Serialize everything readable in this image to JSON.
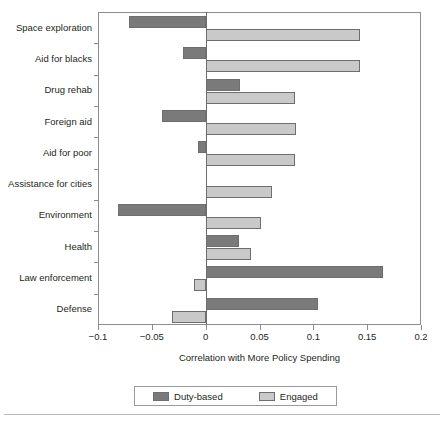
{
  "chart_data": {
    "type": "bar",
    "orientation": "horizontal",
    "title": "",
    "xlabel": "Correlation with More Policy Spending",
    "ylabel": "",
    "xlim": [
      -0.1,
      0.2
    ],
    "xticks": [
      -0.1,
      -0.05,
      0,
      0.05,
      0.1,
      0.15,
      0.2
    ],
    "xticklabels": [
      "−0.1",
      "−0.05",
      "0",
      "0.05",
      "0.1",
      "0.15",
      "0.2"
    ],
    "grid": false,
    "legend_position": "bottom",
    "categories": [
      "Space exploration",
      "Aid for blacks",
      "Drug rehab",
      "Foreign aid",
      "Aid for poor",
      "Assistance for cities",
      "Environment",
      "Health",
      "Law enforcement",
      "Defense"
    ],
    "series": [
      {
        "name": "Duty-based",
        "color": "#7a7a7a",
        "values": [
          -0.071,
          -0.021,
          0.032,
          -0.041,
          -0.007,
          0.0,
          -0.081,
          0.031,
          0.165,
          0.104
        ]
      },
      {
        "name": "Engaged",
        "color": "#c9c9c9",
        "values": [
          0.143,
          0.143,
          0.083,
          0.084,
          0.083,
          0.062,
          0.051,
          0.042,
          -0.011,
          -0.031
        ]
      }
    ]
  },
  "legend": {
    "items": [
      {
        "label": "Duty-based",
        "color": "#7a7a7a"
      },
      {
        "label": "Engaged",
        "color": "#c9c9c9"
      }
    ]
  },
  "axis": {
    "x_title": "Correlation with More Policy Spending"
  }
}
